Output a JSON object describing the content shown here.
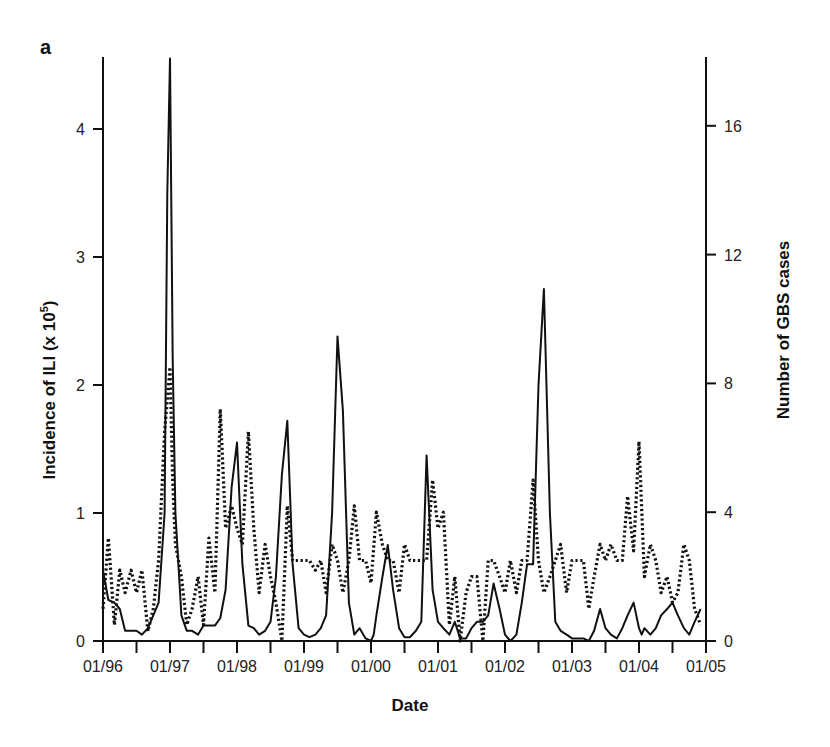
{
  "panel_label": "a",
  "chart_data": {
    "type": "line",
    "title": "",
    "xlabel": "Date",
    "ylabel_left": "Incidence of ILI (x 10^5)",
    "ylabel_left_main": "Incidence of ILI (x 10",
    "ylabel_left_sup": "5",
    "ylabel_left_end": ")",
    "ylabel_right": "Number of GBS cases",
    "x_tick_labels": [
      "01/96",
      "01/97",
      "01/98",
      "01/99",
      "01/00",
      "01/01",
      "01/02",
      "01/03",
      "01/04",
      "01/05"
    ],
    "x_range": [
      1996.0,
      2005.0
    ],
    "ylim_left": [
      0,
      4.5
    ],
    "ylim_right": [
      0,
      18
    ],
    "y_ticks_left": [
      0,
      1,
      2,
      3,
      4
    ],
    "y_ticks_right": [
      0,
      4,
      8,
      12,
      16
    ],
    "grid": false,
    "legend": null,
    "series": [
      {
        "name": "Incidence of ILI",
        "axis": "left",
        "style": "solid",
        "x": [
          1996.0,
          1996.08,
          1996.17,
          1996.25,
          1996.33,
          1996.42,
          1996.5,
          1996.58,
          1996.67,
          1996.75,
          1996.83,
          1996.92,
          1996.96,
          1997.0,
          1997.04,
          1997.08,
          1997.17,
          1997.25,
          1997.33,
          1997.42,
          1997.5,
          1997.58,
          1997.67,
          1997.75,
          1997.83,
          1997.92,
          1998.0,
          1998.08,
          1998.17,
          1998.25,
          1998.33,
          1998.42,
          1998.5,
          1998.58,
          1998.67,
          1998.75,
          1998.83,
          1998.92,
          1999.0,
          1999.08,
          1999.17,
          1999.25,
          1999.33,
          1999.42,
          1999.5,
          1999.58,
          1999.67,
          1999.75,
          1999.83,
          1999.92,
          2000.0,
          2000.04,
          2000.08,
          2000.17,
          2000.25,
          2000.33,
          2000.42,
          2000.5,
          2000.58,
          2000.67,
          2000.75,
          2000.83,
          2000.92,
          2001.0,
          2001.08,
          2001.17,
          2001.25,
          2001.33,
          2001.42,
          2001.5,
          2001.58,
          2001.67,
          2001.75,
          2001.83,
          2001.92,
          2002.0,
          2002.08,
          2002.17,
          2002.25,
          2002.33,
          2002.42,
          2002.5,
          2002.58,
          2002.67,
          2002.75,
          2002.83,
          2002.92,
          2003.0,
          2003.08,
          2003.17,
          2003.25,
          2003.33,
          2003.42,
          2003.5,
          2003.58,
          2003.67,
          2003.75,
          2003.83,
          2003.92,
          2003.96,
          2004.0,
          2004.04,
          2004.08,
          2004.17,
          2004.25,
          2004.33,
          2004.42,
          2004.5,
          2004.58,
          2004.67,
          2004.75,
          2004.83,
          2004.92
        ],
        "values": [
          0.55,
          0.32,
          0.3,
          0.25,
          0.08,
          0.08,
          0.08,
          0.05,
          0.1,
          0.2,
          0.3,
          1.0,
          3.5,
          4.55,
          2.2,
          1.0,
          0.2,
          0.08,
          0.08,
          0.05,
          0.12,
          0.12,
          0.12,
          0.18,
          0.4,
          1.2,
          1.55,
          0.6,
          0.12,
          0.1,
          0.05,
          0.08,
          0.15,
          0.5,
          1.3,
          1.72,
          0.6,
          0.1,
          0.05,
          0.03,
          0.05,
          0.1,
          0.2,
          1.0,
          2.38,
          1.8,
          0.3,
          0.05,
          0.1,
          0.02,
          0.0,
          0.05,
          0.2,
          0.5,
          0.75,
          0.4,
          0.1,
          0.03,
          0.03,
          0.08,
          0.15,
          1.45,
          0.4,
          0.15,
          0.1,
          0.05,
          0.15,
          0.02,
          0.02,
          0.1,
          0.15,
          0.15,
          0.2,
          0.45,
          0.25,
          0.05,
          0.0,
          0.05,
          0.3,
          0.6,
          0.6,
          2.0,
          2.75,
          1.0,
          0.15,
          0.08,
          0.05,
          0.02,
          0.02,
          0.02,
          0.0,
          0.08,
          0.25,
          0.1,
          0.05,
          0.02,
          0.1,
          0.2,
          0.3,
          0.2,
          0.1,
          0.05,
          0.1,
          0.05,
          0.1,
          0.2,
          0.25,
          0.3,
          0.2,
          0.1,
          0.05,
          0.15,
          0.25
        ]
      },
      {
        "name": "Number of GBS cases",
        "axis": "right",
        "style": "dotted",
        "x": [
          1996.0,
          1996.08,
          1996.17,
          1996.25,
          1996.33,
          1996.42,
          1996.5,
          1996.58,
          1996.67,
          1996.75,
          1996.83,
          1996.92,
          1997.0,
          1997.04,
          1997.08,
          1997.17,
          1997.25,
          1997.33,
          1997.42,
          1997.5,
          1997.58,
          1997.67,
          1997.75,
          1997.83,
          1997.92,
          1998.0,
          1998.08,
          1998.17,
          1998.25,
          1998.33,
          1998.42,
          1998.5,
          1998.58,
          1998.67,
          1998.75,
          1998.83,
          1998.92,
          1999.0,
          1999.08,
          1999.17,
          1999.25,
          1999.33,
          1999.42,
          1999.5,
          1999.58,
          1999.67,
          1999.75,
          1999.83,
          1999.92,
          2000.0,
          2000.08,
          2000.17,
          2000.25,
          2000.33,
          2000.42,
          2000.5,
          2000.58,
          2000.67,
          2000.75,
          2000.83,
          2000.92,
          2001.0,
          2001.08,
          2001.17,
          2001.25,
          2001.33,
          2001.42,
          2001.5,
          2001.58,
          2001.67,
          2001.75,
          2001.83,
          2001.92,
          2002.0,
          2002.08,
          2002.17,
          2002.25,
          2002.33,
          2002.42,
          2002.5,
          2002.58,
          2002.67,
          2002.75,
          2002.83,
          2002.92,
          2003.0,
          2003.08,
          2003.17,
          2003.25,
          2003.33,
          2003.42,
          2003.5,
          2003.58,
          2003.67,
          2003.75,
          2003.83,
          2003.92,
          2004.0,
          2004.08,
          2004.17,
          2004.25,
          2004.33,
          2004.42,
          2004.5,
          2004.58,
          2004.67,
          2004.75,
          2004.83,
          2004.92
        ],
        "values": [
          1,
          3.2,
          0.5,
          2.2,
          1.5,
          2.2,
          1.5,
          2.2,
          0.3,
          1.0,
          2.5,
          6.5,
          8.5,
          5,
          3,
          2,
          0.5,
          1,
          2,
          0.5,
          3.2,
          1.5,
          7.2,
          3.5,
          4.2,
          3.5,
          3,
          6.5,
          3.5,
          1.5,
          3,
          2,
          1.2,
          0,
          4.2,
          2.5,
          2.5,
          2.5,
          2.5,
          2.2,
          2.5,
          1.5,
          3,
          2.5,
          1.5,
          2.5,
          4.2,
          2.5,
          2.5,
          1.8,
          4,
          3,
          2.5,
          2.5,
          1.5,
          3,
          2.5,
          2.5,
          2.5,
          2.5,
          5,
          3.5,
          4,
          0.5,
          2,
          0,
          1.5,
          2,
          2,
          0,
          2.5,
          2.5,
          2,
          1.5,
          2.5,
          1.5,
          2.5,
          2.5,
          5,
          2.5,
          1.5,
          2,
          2.5,
          3,
          1.5,
          2.5,
          2.5,
          2.5,
          1,
          2,
          3,
          2.5,
          3,
          2.5,
          2.5,
          4.5,
          2.8,
          6.2,
          2,
          3,
          2.5,
          1.5,
          2,
          1.2,
          1.5,
          3,
          2.5,
          1,
          0.5
        ]
      }
    ]
  }
}
